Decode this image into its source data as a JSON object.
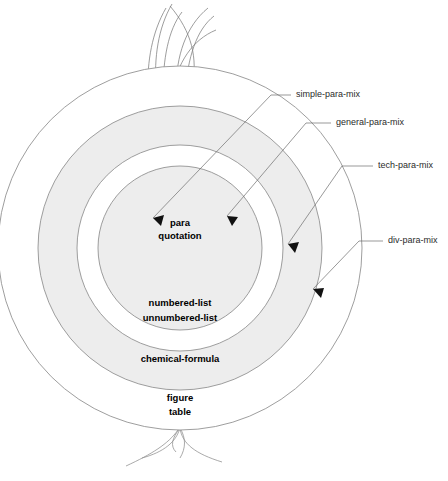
{
  "figure": {
    "center": {
      "x": 180,
      "y": 248
    },
    "background_color": "#ffffff",
    "outline_color": "#8d8d8d",
    "shaded_ring_color": "#ededed",
    "plain_ring_color": "#ffffff",
    "label_color": "#000000",
    "callout_color": "#2b2b2b"
  },
  "rings": [
    {
      "id": "core",
      "fill": "shaded",
      "radius": 82,
      "entities": [
        "para",
        "quotation"
      ],
      "label_lines": [
        {
          "text": "para",
          "x": 180,
          "y": 223
        },
        {
          "text": "quotation",
          "x": 180,
          "y": 236
        }
      ]
    },
    {
      "id": "ring-1",
      "fill": "plain",
      "radius": 103,
      "entities": [
        "numbered-list",
        "unnumbered-list"
      ],
      "label_lines": [
        {
          "text": "numbered-list",
          "x": 180,
          "y": 303
        },
        {
          "text": "unnumbered-list",
          "x": 180,
          "y": 318
        }
      ]
    },
    {
      "id": "ring-2",
      "fill": "shaded",
      "radius": 142,
      "entities": [
        "chemical-formula"
      ],
      "label_lines": [
        {
          "text": "chemical-formula",
          "x": 180,
          "y": 359
        }
      ]
    },
    {
      "id": "ring-3",
      "fill": "plain",
      "radius": 182,
      "entities": [
        "figure",
        "table"
      ],
      "label_lines": [
        {
          "text": "figure",
          "x": 180,
          "y": 398
        },
        {
          "text": "table",
          "x": 180,
          "y": 412
        }
      ]
    }
  ],
  "callouts": [
    {
      "id": "simple-para-mix",
      "label": "simple-para-mix",
      "label_x": 296,
      "label_y": 95,
      "leader": "M 291 95 L 271 95 L 153 218",
      "arrow_points": "153,218 162,214 160,224"
    },
    {
      "id": "general-para-mix",
      "label": "general-para-mix",
      "label_x": 336,
      "label_y": 123,
      "leader": "M 331 123 L 306 123 L 227 216",
      "arrow_points": "227,216 237,217 230,225"
    },
    {
      "id": "tech-para-mix",
      "label": "tech-para-mix",
      "label_x": 378,
      "label_y": 166,
      "leader": "M 373 166 L 342 166 L 288 244",
      "arrow_points": "288,244 297,242 294,252"
    },
    {
      "id": "div-para-mix",
      "label": "div-para-mix",
      "label_x": 388,
      "label_y": 241,
      "leader": "M 383 241 L 359 241 L 313 289",
      "arrow_points": "313,289 322,287 320,297"
    }
  ],
  "ornaments": {
    "sprout_count": 7,
    "root_count": 4,
    "sprout_note": "grass-like shoots rising from top of outermost circle",
    "root_note": "thin roots descending from bottom of outermost circle"
  },
  "caption": {
    "text": ""
  }
}
